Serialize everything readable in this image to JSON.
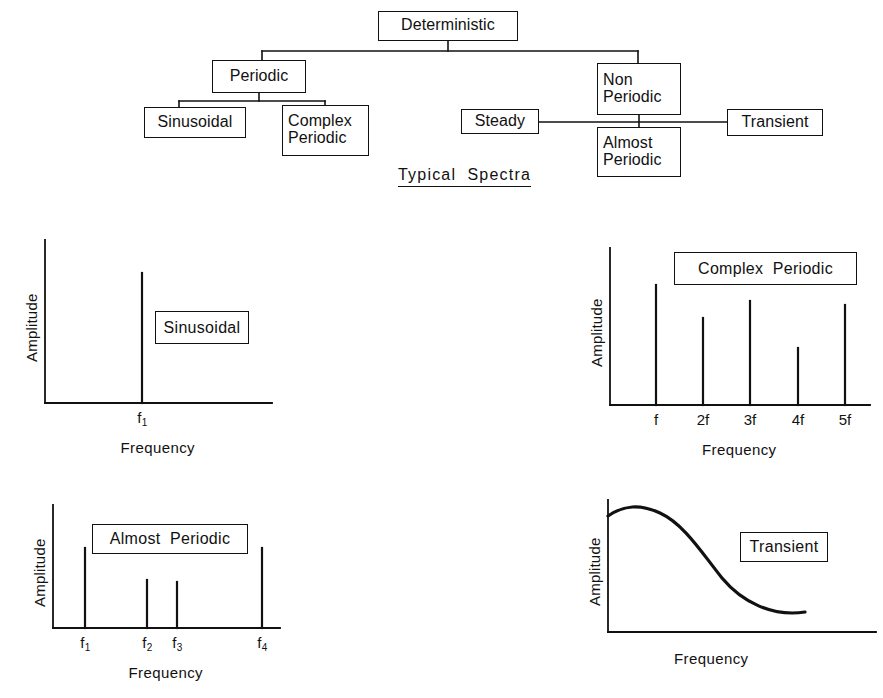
{
  "figure": {
    "caption": "Typical  Spectra"
  },
  "tree": {
    "nodes": [
      {
        "id": "deterministic",
        "label": "Deterministic",
        "x": 378,
        "y": 11,
        "w": 140,
        "h": 30,
        "align": "center"
      },
      {
        "id": "periodic",
        "label": "Periodic",
        "x": 212,
        "y": 60,
        "w": 94,
        "h": 33,
        "align": "center"
      },
      {
        "id": "sinusoidal",
        "label": "Sinusoidal",
        "x": 144,
        "y": 107,
        "w": 102,
        "h": 31,
        "align": "center"
      },
      {
        "id": "complex-periodic",
        "label": "Complex\nPeriodic",
        "x": 282,
        "y": 105,
        "w": 87,
        "h": 51,
        "align": "left"
      },
      {
        "id": "non-periodic",
        "label": "Non\nPeriodic",
        "x": 597,
        "y": 63,
        "w": 84,
        "h": 52,
        "align": "left"
      },
      {
        "id": "steady",
        "label": "Steady",
        "x": 461,
        "y": 109,
        "w": 78,
        "h": 25,
        "align": "center"
      },
      {
        "id": "almost-periodic",
        "label": "Almost\nPeriodic",
        "x": 597,
        "y": 127,
        "w": 84,
        "h": 50,
        "align": "left"
      },
      {
        "id": "transient",
        "label": "Transient",
        "x": 727,
        "y": 109,
        "w": 96,
        "h": 27,
        "align": "center"
      }
    ],
    "connectors": [
      "M448,41 L448,51",
      "M262,51 L638,51",
      "M262,51 L262,60",
      "M638,51 L638,63",
      "M259,93 L259,101",
      "M179,101 L325,101",
      "M179,101 L179,107",
      "M325,101 L325,105",
      "M639,115 L639,127",
      "M539,122 L727,122"
    ]
  },
  "chart_data": [
    {
      "id": "sinusoidal-spectrum",
      "type": "bar",
      "title": "Sinusoidal",
      "xlabel": "Frequency",
      "ylabel": "Amplitude",
      "grid": false,
      "legend": "none",
      "categories": [
        "f₁"
      ],
      "tick_labels": [
        {
          "text": "f",
          "sub": "1"
        }
      ],
      "values": [
        0.87
      ],
      "ylim": [
        0,
        1
      ],
      "plot": {
        "x0": 45,
        "y0": 403,
        "x1": 272,
        "yTop": 240
      },
      "lines": [
        "M142,403 L142,273"
      ],
      "tag": {
        "x": 155,
        "y": 311,
        "w": 94,
        "h": 33
      },
      "ticks_px": [
        142
      ]
    },
    {
      "id": "complex-periodic-spectrum",
      "type": "bar",
      "title": "Complex  Periodic",
      "xlabel": "Frequency",
      "ylabel": "Amplitude",
      "grid": false,
      "legend": "none",
      "categories": [
        "f",
        "2f",
        "3f",
        "4f",
        "5f"
      ],
      "tick_labels": [
        {
          "text": "f",
          "sub": ""
        },
        {
          "text": "2f",
          "sub": ""
        },
        {
          "text": "3f",
          "sub": ""
        },
        {
          "text": "4f",
          "sub": ""
        },
        {
          "text": "5f",
          "sub": ""
        }
      ],
      "values": [
        1.0,
        0.73,
        0.86,
        0.49,
        0.82
      ],
      "ylim": [
        0,
        1
      ],
      "plot": {
        "x0": 610,
        "y0": 405,
        "x1": 870,
        "yTop": 248
      },
      "lines": [
        "M656,405 L656,285",
        "M703,405 L703,318",
        "M750,405 L750,301",
        "M798,405 L798,348",
        "M845,405 L845,305"
      ],
      "tag": {
        "x": 674,
        "y": 252,
        "w": 183,
        "h": 33
      },
      "ticks_px": [
        656,
        703,
        750,
        798,
        845
      ]
    },
    {
      "id": "almost-periodic-spectrum",
      "type": "bar",
      "title": "Almost  Periodic",
      "xlabel": "Frequency",
      "ylabel": "Amplitude",
      "grid": false,
      "legend": "none",
      "categories": [
        "f₁",
        "f₂",
        "f₃",
        "f₄"
      ],
      "tick_labels": [
        {
          "text": "f",
          "sub": "1"
        },
        {
          "text": "f",
          "sub": "2"
        },
        {
          "text": "f",
          "sub": "3"
        },
        {
          "text": "f",
          "sub": "4"
        }
      ],
      "values": [
        1.0,
        0.6,
        0.58,
        1.0
      ],
      "ylim": [
        0,
        1
      ],
      "plot": {
        "x0": 53,
        "y0": 628,
        "x1": 280,
        "yTop": 505
      },
      "lines": [
        "M85,628 L85,548",
        "M147,628 L147,580",
        "M177,628 L177,582",
        "M262,628 L262,548"
      ],
      "tag": {
        "x": 92,
        "y": 524,
        "w": 156,
        "h": 30
      },
      "ticks_px": [
        85,
        147,
        177,
        262
      ]
    },
    {
      "id": "transient-spectrum",
      "type": "line",
      "title": "Transient",
      "xlabel": "Frequency",
      "ylabel": "Amplitude",
      "grid": false,
      "legend": "none",
      "x": [
        0.0,
        0.08,
        0.18,
        0.3,
        0.42,
        0.55,
        0.68,
        0.8
      ],
      "y": [
        0.95,
        1.0,
        0.99,
        0.86,
        0.62,
        0.38,
        0.22,
        0.14
      ],
      "ylim": [
        0,
        1
      ],
      "plot": {
        "x0": 608,
        "y0": 632,
        "x1": 876,
        "yTop": 500
      },
      "curve": "M608,516 C624,505 640,504 660,513 C684,524 702,553 722,578 C742,602 772,617 805,612",
      "tag": {
        "x": 740,
        "y": 532,
        "w": 88,
        "h": 30
      },
      "ticks_px": []
    }
  ]
}
